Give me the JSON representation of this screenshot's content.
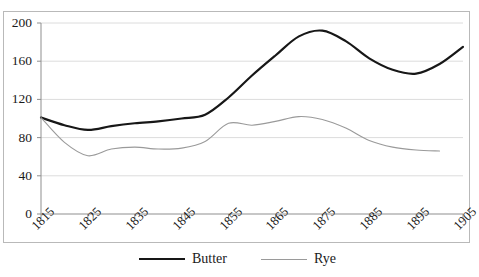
{
  "chart_data": {
    "type": "line",
    "title": "",
    "subtitle": "",
    "xlabel": "",
    "ylabel": "",
    "xlim": [
      1815,
      1905
    ],
    "ylim": [
      0,
      200
    ],
    "grid": true,
    "grid_axis": "y",
    "legend_position": "bottom",
    "y_ticks": [
      0,
      40,
      80,
      120,
      160,
      200
    ],
    "y_tick_labels": [
      "0",
      "40",
      "80",
      "120",
      "160",
      "200"
    ],
    "x_ticks": [
      1815,
      1825,
      1835,
      1845,
      1855,
      1865,
      1875,
      1885,
      1895,
      1905
    ],
    "x_tick_labels": [
      "1815",
      "1825",
      "1835",
      "1845",
      "1855",
      "1865",
      "1875",
      "1885",
      "1895",
      "1905"
    ],
    "x": [
      1815,
      1820,
      1825,
      1830,
      1835,
      1840,
      1845,
      1850,
      1855,
      1860,
      1865,
      1870,
      1875,
      1880,
      1885,
      1890,
      1895,
      1900,
      1905
    ],
    "series": [
      {
        "name": "Butter",
        "color": "#171717",
        "line_width": 2.2,
        "values": [
          101,
          93,
          88,
          92,
          95,
          97,
          100,
          104,
          122,
          145,
          166,
          186,
          192,
          181,
          163,
          151,
          147,
          157,
          175
        ]
      },
      {
        "name": "Rye",
        "color": "#9a9a9a",
        "line_width": 1.1,
        "values": [
          101,
          75,
          61,
          68,
          70,
          68,
          69,
          76,
          95,
          93,
          97,
          102,
          99,
          90,
          77,
          70,
          67,
          66,
          null
        ]
      }
    ]
  },
  "legend": {
    "items": [
      {
        "label": "Butter",
        "swatch": "butter"
      },
      {
        "label": "Rye",
        "swatch": "rye"
      }
    ]
  }
}
